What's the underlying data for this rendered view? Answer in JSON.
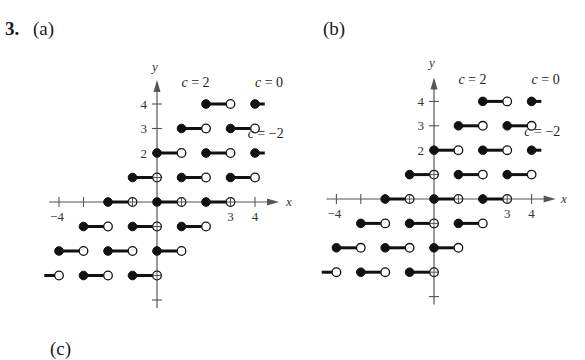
{
  "header": {
    "problem_number": "3.",
    "panels": [
      {
        "id": "a",
        "label": "(a)"
      },
      {
        "id": "b",
        "label": "(b)"
      },
      {
        "id": "c",
        "label": "(c)"
      }
    ]
  },
  "chart_data": [
    {
      "type": "line",
      "title": "(a)",
      "description": "Step functions f(x) = [[x]] + c for c = 2, 0, -2; filled dot at left endpoint, open dot at right endpoint",
      "xlabel": "x",
      "ylabel": "y",
      "xlim": [
        -4,
        4
      ],
      "ylim": [
        -4,
        4
      ],
      "x_tick_labels": {
        "-4": "-4",
        "3": "3",
        "4": "4"
      },
      "y_tick_labels": {
        "2": "2",
        "3": "3",
        "4": "4"
      },
      "grid": false,
      "annotations": [
        {
          "text": "c = 2",
          "x": 1.0,
          "y": 4.7
        },
        {
          "text": "c = 0",
          "x": 4.0,
          "y": 4.7
        },
        {
          "text": "c = −2",
          "x": 3.7,
          "y": 2.6
        }
      ],
      "series": [
        {
          "name": "c = 2",
          "segments": [
            [
              -5,
              -4,
              -3
            ],
            [
              -4,
              -3,
              -2
            ],
            [
              -3,
              -2,
              -1
            ],
            [
              -2,
              -1,
              0
            ],
            [
              -1,
              0,
              1
            ],
            [
              0,
              1,
              2
            ],
            [
              1,
              2,
              3
            ],
            [
              2,
              3,
              4
            ]
          ]
        },
        {
          "name": "c = 0",
          "segments": [
            [
              -3,
              -2,
              -3
            ],
            [
              -2,
              -1,
              -2
            ],
            [
              -1,
              0,
              -1
            ],
            [
              0,
              1,
              0
            ],
            [
              1,
              2,
              1
            ],
            [
              2,
              3,
              2
            ],
            [
              3,
              4,
              3
            ],
            [
              4,
              4.4,
              4
            ]
          ]
        },
        {
          "name": "c = -2",
          "segments": [
            [
              -4,
              -3,
              -6
            ],
            [
              -1,
              0,
              -3
            ],
            [
              0,
              1,
              -2
            ],
            [
              1,
              2,
              -1
            ],
            [
              2,
              3,
              0
            ],
            [
              3,
              4,
              1
            ],
            [
              4,
              4.4,
              2
            ]
          ]
        }
      ]
    },
    {
      "type": "line",
      "title": "(b)",
      "description": "Step functions f(x) = [[x]] + c for c = 2, 0, -2; filled dot at left endpoint, open dot at right endpoint",
      "xlabel": "x",
      "ylabel": "y",
      "xlim": [
        -4,
        4
      ],
      "ylim": [
        -4,
        4
      ],
      "x_tick_labels": {
        "-4": "-4",
        "3": "3",
        "4": "4"
      },
      "y_tick_labels": {
        "2": "2",
        "3": "3",
        "4": "4"
      },
      "grid": false,
      "annotations": [
        {
          "text": "c = 2",
          "x": 1.0,
          "y": 4.7
        },
        {
          "text": "c = 0",
          "x": 4.0,
          "y": 4.7
        },
        {
          "text": "c = −2",
          "x": 3.7,
          "y": 2.6
        }
      ],
      "series": [
        {
          "name": "c = 2",
          "segments": [
            [
              -5,
              -4,
              -3
            ],
            [
              -4,
              -3,
              -2
            ],
            [
              -3,
              -2,
              -1
            ],
            [
              -2,
              -1,
              0
            ],
            [
              -1,
              0,
              1
            ],
            [
              0,
              1,
              2
            ],
            [
              1,
              2,
              3
            ],
            [
              2,
              3,
              4
            ]
          ]
        },
        {
          "name": "c = 0",
          "segments": [
            [
              -3,
              -2,
              -3
            ],
            [
              -2,
              -1,
              -2
            ],
            [
              -1,
              0,
              -1
            ],
            [
              0,
              1,
              0
            ],
            [
              1,
              2,
              1
            ],
            [
              2,
              3,
              2
            ],
            [
              3,
              4,
              3
            ],
            [
              4,
              4.4,
              4
            ]
          ]
        },
        {
          "name": "c = -2",
          "segments": [
            [
              -4,
              -3,
              -6
            ],
            [
              -1,
              0,
              -3
            ],
            [
              0,
              1,
              -2
            ],
            [
              1,
              2,
              -1
            ],
            [
              2,
              3,
              0
            ],
            [
              3,
              4,
              1
            ],
            [
              4,
              4.4,
              2
            ]
          ]
        }
      ]
    }
  ],
  "graph_layout": [
    {
      "origin_x": 157,
      "origin_y": 202,
      "unit": 24.5,
      "y_label_pos": [
        155,
        71
      ],
      "x_label_pos": [
        286,
        206
      ]
    },
    {
      "origin_x": 434,
      "origin_y": 199,
      "unit": 24.4,
      "y_label_pos": [
        432,
        67
      ],
      "x_label_pos": [
        561,
        203
      ]
    }
  ]
}
